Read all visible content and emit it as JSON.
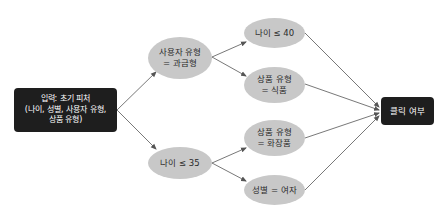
{
  "diagram": {
    "type": "flow-graph",
    "nodes": {
      "input": {
        "shape": "rounded-rect",
        "lines": [
          "입력: 초기 피처",
          "(나이, 성별, 사용자 유형,",
          "상품 유형)"
        ]
      },
      "user_type": {
        "shape": "ellipse",
        "lines": [
          "사용자 유형",
          "= 과금형"
        ]
      },
      "age35": {
        "shape": "ellipse",
        "lines": [
          "나이 ≤ 35"
        ]
      },
      "age40": {
        "shape": "ellipse",
        "lines": [
          "나이 ≤ 40"
        ]
      },
      "product_food": {
        "shape": "ellipse",
        "lines": [
          "상품 유형",
          "= 식품"
        ]
      },
      "product_cosmetic": {
        "shape": "ellipse",
        "lines": [
          "상품 유형",
          "= 화장품"
        ]
      },
      "gender_female": {
        "shape": "ellipse",
        "lines": [
          "성별 = 여자"
        ]
      },
      "output": {
        "shape": "rounded-rect",
        "lines": [
          "클릭 여부"
        ]
      }
    },
    "edges": [
      {
        "from": "input",
        "to": "user_type"
      },
      {
        "from": "input",
        "to": "age35"
      },
      {
        "from": "user_type",
        "to": "age40"
      },
      {
        "from": "user_type",
        "to": "product_food"
      },
      {
        "from": "age35",
        "to": "product_cosmetic"
      },
      {
        "from": "age35",
        "to": "gender_female"
      },
      {
        "from": "age40",
        "to": "output"
      },
      {
        "from": "product_food",
        "to": "output"
      },
      {
        "from": "product_cosmetic",
        "to": "output"
      },
      {
        "from": "gender_female",
        "to": "output"
      }
    ],
    "colors": {
      "box_fill": "#1e1e1e",
      "box_text": "#ffffff",
      "ellipse_fill": "#c8c8c8",
      "ellipse_text": "#2a2a2a",
      "edge": "#555555"
    }
  }
}
